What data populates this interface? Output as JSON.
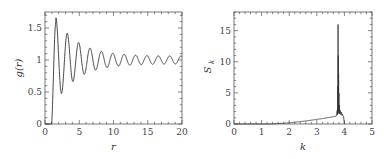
{
  "chart_data": [
    {
      "type": "line",
      "title": "",
      "xlabel": "r",
      "ylabel": "g(r)",
      "xlim": [
        0,
        20
      ],
      "ylim": [
        0,
        1.75
      ],
      "xticks": [
        "0",
        "5",
        "10",
        "15",
        "20"
      ],
      "yticks": [
        "0",
        "0.5",
        "1",
        "1.5"
      ],
      "grid": false,
      "legend": null,
      "description": "Radial distribution function: zero until r≈1, sharp first peak ~1.6 at r≈1.6, damped oscillations with period ≈1.65 converging to 1",
      "x": [
        0,
        0.9,
        1.1,
        1.3,
        1.6,
        2.4,
        3.3,
        4.1,
        4.9,
        5.8,
        6.6,
        7.4,
        8.3,
        9.1,
        10.0,
        10.8,
        11.6,
        12.5,
        13.3,
        14.1,
        15.0,
        15.8,
        16.6,
        17.4,
        18.3,
        19.1,
        20.0
      ],
      "values": [
        0,
        0,
        0.4,
        1.1,
        1.6,
        0.65,
        1.25,
        0.8,
        1.15,
        0.87,
        1.12,
        0.9,
        1.1,
        0.92,
        1.08,
        0.93,
        1.07,
        0.94,
        1.07,
        0.95,
        1.06,
        0.95,
        1.06,
        0.95,
        1.06,
        0.96,
        1.02
      ]
    },
    {
      "type": "line",
      "title": "",
      "xlabel": "k",
      "ylabel": "S_k",
      "xlim": [
        0,
        5
      ],
      "ylim": [
        0,
        18
      ],
      "xticks": [
        "0",
        "1",
        "2",
        "3",
        "4",
        "5"
      ],
      "yticks": [
        "0",
        "5",
        "10",
        "15"
      ],
      "grid": false,
      "legend": null,
      "description": "Structure factor: near zero until k≈1.5, slow rise to ~1.2 at k≈3.6, sharp spike up to ~16 at k≈3.78, noisy cluster ~2 then drops to 0 by k≈4",
      "x": [
        0,
        1.0,
        1.5,
        2.0,
        2.5,
        3.0,
        3.5,
        3.7,
        3.75,
        3.78,
        3.8,
        3.82,
        3.85,
        3.9,
        3.95,
        4.0
      ],
      "values": [
        0,
        0,
        0.05,
        0.35,
        0.6,
        0.9,
        1.2,
        1.8,
        5.0,
        16.0,
        11.0,
        2.0,
        1.9,
        1.6,
        1.4,
        0
      ]
    }
  ],
  "plots": {
    "left": {
      "ylabel": "g(r)",
      "xlabel": "r",
      "xtick_labels": [
        "0",
        "5",
        "10",
        "15",
        "20"
      ],
      "ytick_labels": [
        "0",
        "0.5",
        "1",
        "1.5"
      ]
    },
    "right": {
      "ylabel_main": "S",
      "ylabel_sub": "k",
      "xlabel": "k",
      "xtick_labels": [
        "0",
        "1",
        "2",
        "3",
        "4",
        "5"
      ],
      "ytick_labels": [
        "0",
        "5",
        "10",
        "15"
      ]
    }
  },
  "colors": {
    "line": "#333333",
    "frame": "#555555"
  }
}
